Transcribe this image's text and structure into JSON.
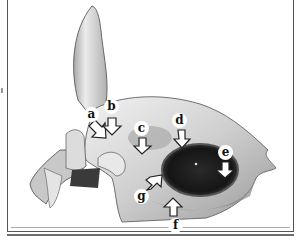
{
  "figure": {
    "labels": [
      {
        "id": "a",
        "text": "a",
        "x": 91,
        "y": 107,
        "arrow_dir": "down-right"
      },
      {
        "id": "b",
        "text": "b",
        "x": 105,
        "y": 100,
        "arrow_dir": "down"
      },
      {
        "id": "c",
        "text": "c",
        "x": 139,
        "y": 120,
        "arrow_dir": "down"
      },
      {
        "id": "d",
        "text": "d",
        "x": 172,
        "y": 112,
        "arrow_dir": "down"
      },
      {
        "id": "e",
        "text": "e",
        "x": 216,
        "y": 145,
        "arrow_dir": "down"
      },
      {
        "id": "f",
        "text": "f",
        "x": 168,
        "y": 220,
        "arrow_dir": "up"
      },
      {
        "id": "g",
        "text": "g",
        "x": 136,
        "y": 190,
        "arrow_dir": "up-right"
      }
    ]
  },
  "colors": {
    "border": "#555555",
    "bone_light": "#e6e6e6",
    "bone_mid": "#bdbdbd",
    "shadow": "#4a4a4a",
    "orbit": "#1e1e1e"
  }
}
